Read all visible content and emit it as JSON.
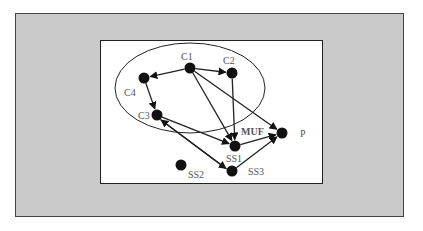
{
  "colors": {
    "panel_bg": "#cacaca",
    "box_bg": "#ffffff",
    "stroke": "#222222",
    "node_fill": "#111111",
    "label": "#555555"
  },
  "cluster": {
    "cx": 190,
    "cy": 88,
    "rx": 75,
    "ry": 45
  },
  "nodes": [
    {
      "id": "C1",
      "label": "C1",
      "x": 190,
      "y": 68,
      "lx": 181,
      "ly": 60,
      "bold": false
    },
    {
      "id": "C2",
      "label": "C2",
      "x": 232,
      "y": 73,
      "lx": 223,
      "ly": 64,
      "bold": false
    },
    {
      "id": "C4",
      "label": "C4",
      "x": 144,
      "y": 78,
      "lx": 124,
      "ly": 96,
      "bold": false
    },
    {
      "id": "C3",
      "label": "C3",
      "x": 157,
      "y": 115,
      "lx": 138,
      "ly": 119,
      "bold": false
    },
    {
      "id": "SS1",
      "label": "SS1",
      "x": 235,
      "y": 146,
      "lx": 226,
      "ly": 162,
      "bold": false
    },
    {
      "id": "MUF",
      "label": "MUF",
      "x": null,
      "y": null,
      "lx": 241,
      "ly": 135,
      "bold": true
    },
    {
      "id": "P",
      "label": "P",
      "x": 282,
      "y": 133,
      "lx": 300,
      "ly": 137,
      "bold": false
    },
    {
      "id": "SS2",
      "label": "SS2",
      "x": 181,
      "y": 165,
      "lx": 188,
      "ly": 178,
      "bold": false
    },
    {
      "id": "SS3",
      "label": "SS3",
      "x": 232,
      "y": 171,
      "lx": 248,
      "ly": 175,
      "bold": false
    }
  ],
  "edges": [
    {
      "from": "C1",
      "to": "C4"
    },
    {
      "from": "C1",
      "to": "C2"
    },
    {
      "from": "C4",
      "to": "C3"
    },
    {
      "from": "C1",
      "to": "SS1"
    },
    {
      "from": "C2",
      "to": "SS1"
    },
    {
      "from": "C1",
      "to": "P"
    },
    {
      "from": "C3",
      "to": "SS1"
    },
    {
      "from": "C3",
      "to": "SS3"
    },
    {
      "from": "SS3",
      "to": "C3"
    },
    {
      "from": "SS1",
      "to": "P"
    },
    {
      "from": "SS3",
      "to": "P"
    }
  ]
}
